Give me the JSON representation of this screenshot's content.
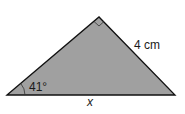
{
  "diagram": {
    "type": "right-triangle",
    "fill_color": "#a0a0a0",
    "stroke_color": "#111111",
    "vertices": {
      "bottom_left": [
        7,
        95
      ],
      "apex": [
        99,
        17
      ],
      "bottom_right": [
        175,
        95
      ]
    },
    "right_angle_at": "apex",
    "labels": {
      "angle": "41°",
      "hypotenuse_side": "4 cm",
      "base": "x"
    }
  }
}
